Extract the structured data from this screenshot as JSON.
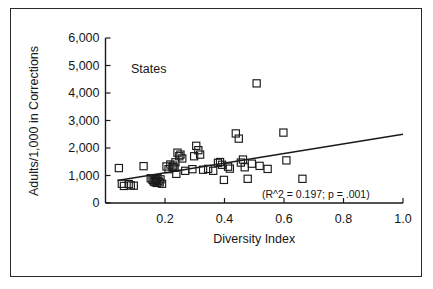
{
  "chart_data": {
    "type": "scatter",
    "title": "",
    "series_label": "States",
    "xlabel": "Diversity Index",
    "ylabel": "Adults/1,000 in Corrections",
    "xlim": [
      0.0,
      1.0
    ],
    "ylim": [
      0,
      6000
    ],
    "xticks": [
      0.2,
      0.4,
      0.6,
      0.8,
      1.0
    ],
    "xtick_labels": [
      "0.2",
      "0.4",
      "0.6",
      "0.8",
      "1.0"
    ],
    "yticks": [
      0,
      1000,
      2000,
      3000,
      4000,
      5000,
      6000
    ],
    "ytick_labels": [
      "0",
      "1,000",
      "2,000",
      "3,000",
      "4,000",
      "5,000",
      "6,000"
    ],
    "grid": false,
    "legend": "none",
    "marker": "open-square",
    "marker_color": "#1a1a1a",
    "annotation": "(R^2 = 0.197; p = .001)",
    "r_squared": 0.197,
    "p_value": 0.001,
    "trendline": {
      "type": "linear",
      "x_start": 0.04,
      "y_start": 820,
      "x_end": 1.0,
      "y_end": 2500
    },
    "points": [
      {
        "x": 0.045,
        "y": 1270
      },
      {
        "x": 0.055,
        "y": 700
      },
      {
        "x": 0.062,
        "y": 620
      },
      {
        "x": 0.078,
        "y": 690
      },
      {
        "x": 0.085,
        "y": 640
      },
      {
        "x": 0.095,
        "y": 630
      },
      {
        "x": 0.128,
        "y": 1340
      },
      {
        "x": 0.152,
        "y": 900
      },
      {
        "x": 0.158,
        "y": 840
      },
      {
        "x": 0.162,
        "y": 790
      },
      {
        "x": 0.165,
        "y": 760
      },
      {
        "x": 0.168,
        "y": 870
      },
      {
        "x": 0.17,
        "y": 820
      },
      {
        "x": 0.172,
        "y": 730
      },
      {
        "x": 0.175,
        "y": 900
      },
      {
        "x": 0.178,
        "y": 800
      },
      {
        "x": 0.182,
        "y": 750
      },
      {
        "x": 0.185,
        "y": 860
      },
      {
        "x": 0.19,
        "y": 700
      },
      {
        "x": 0.205,
        "y": 1330
      },
      {
        "x": 0.212,
        "y": 1230
      },
      {
        "x": 0.218,
        "y": 1400
      },
      {
        "x": 0.225,
        "y": 1310
      },
      {
        "x": 0.228,
        "y": 1360
      },
      {
        "x": 0.232,
        "y": 1280
      },
      {
        "x": 0.235,
        "y": 1480
      },
      {
        "x": 0.238,
        "y": 1060
      },
      {
        "x": 0.242,
        "y": 1830
      },
      {
        "x": 0.248,
        "y": 1700
      },
      {
        "x": 0.252,
        "y": 1760
      },
      {
        "x": 0.258,
        "y": 1620
      },
      {
        "x": 0.268,
        "y": 1170
      },
      {
        "x": 0.292,
        "y": 1230
      },
      {
        "x": 0.298,
        "y": 1700
      },
      {
        "x": 0.305,
        "y": 2080
      },
      {
        "x": 0.312,
        "y": 1920
      },
      {
        "x": 0.318,
        "y": 1760
      },
      {
        "x": 0.328,
        "y": 1210
      },
      {
        "x": 0.345,
        "y": 1240
      },
      {
        "x": 0.362,
        "y": 1170
      },
      {
        "x": 0.378,
        "y": 1460
      },
      {
        "x": 0.385,
        "y": 1490
      },
      {
        "x": 0.392,
        "y": 1390
      },
      {
        "x": 0.398,
        "y": 840
      },
      {
        "x": 0.412,
        "y": 1320
      },
      {
        "x": 0.418,
        "y": 1250
      },
      {
        "x": 0.438,
        "y": 2530
      },
      {
        "x": 0.448,
        "y": 2340
      },
      {
        "x": 0.455,
        "y": 1470
      },
      {
        "x": 0.462,
        "y": 1580
      },
      {
        "x": 0.468,
        "y": 1300
      },
      {
        "x": 0.478,
        "y": 880
      },
      {
        "x": 0.492,
        "y": 1430
      },
      {
        "x": 0.508,
        "y": 4350
      },
      {
        "x": 0.518,
        "y": 1350
      },
      {
        "x": 0.545,
        "y": 1240
      },
      {
        "x": 0.598,
        "y": 2560
      },
      {
        "x": 0.608,
        "y": 1550
      },
      {
        "x": 0.662,
        "y": 880
      }
    ]
  }
}
